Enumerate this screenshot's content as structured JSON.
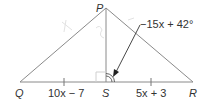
{
  "diagram": {
    "vertices": {
      "P": "P",
      "Q": "Q",
      "S": "S",
      "R": "R"
    },
    "segments": {
      "QS": "10x − 7",
      "SR": "5x + 3"
    },
    "angle_label": "−15x + 42°",
    "colors": {
      "line": "#8a8a8a",
      "text": "#333333",
      "pencil": "#dddddd"
    }
  }
}
